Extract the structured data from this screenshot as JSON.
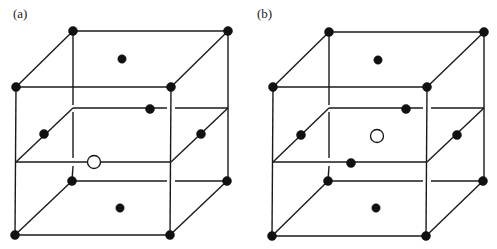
{
  "figure": {
    "colors": {
      "line": "#1a1a1a",
      "filled_atom": "#111111",
      "open_atom_fill": "#ffffff"
    },
    "panels": [
      {
        "id": "a",
        "label": "(a)",
        "open_site": "front edge of mid-plane (edge-center position)",
        "filled_atoms": [
          "top-back-left corner",
          "top-back-right corner",
          "top-front-left corner",
          "top-front-right corner",
          "top face center",
          "mid-plane back edge",
          "mid-plane left edge",
          "mid-plane right edge",
          "bottom-back-left corner",
          "bottom-back-right corner",
          "bottom-front-left corner",
          "bottom-front-right corner",
          "bottom face center"
        ],
        "open_atoms": [
          "mid-plane front edge"
        ]
      },
      {
        "id": "b",
        "label": "(b)",
        "open_site": "center of mid-plane (body-center position)",
        "filled_atoms": [
          "top-back-left corner",
          "top-back-right corner",
          "top-front-left corner",
          "top-front-right corner",
          "top face center",
          "mid-plane back edge",
          "mid-plane left edge",
          "mid-plane right edge",
          "mid-plane front edge",
          "bottom-back-left corner",
          "bottom-back-right corner",
          "bottom-front-left corner",
          "bottom-front-right corner",
          "bottom face center"
        ],
        "open_atoms": [
          "mid-plane center"
        ]
      }
    ]
  }
}
